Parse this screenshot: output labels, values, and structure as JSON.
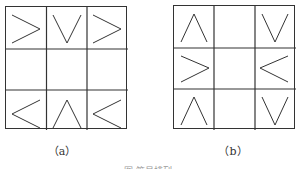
{
  "figures": [
    {
      "id": "a",
      "label": "（a）",
      "cells": [
        [
          ">",
          "V",
          ">"
        ],
        [
          "",
          "",
          ""
        ],
        [
          "<",
          "Λ",
          "<"
        ]
      ]
    },
    {
      "id": "b",
      "label": "（b）",
      "cells": [
        [
          "Λ",
          "",
          "V"
        ],
        [
          ">",
          "",
          "<"
        ],
        [
          "Λ",
          "",
          "V"
        ]
      ]
    }
  ],
  "caption": "图 符号排列"
}
